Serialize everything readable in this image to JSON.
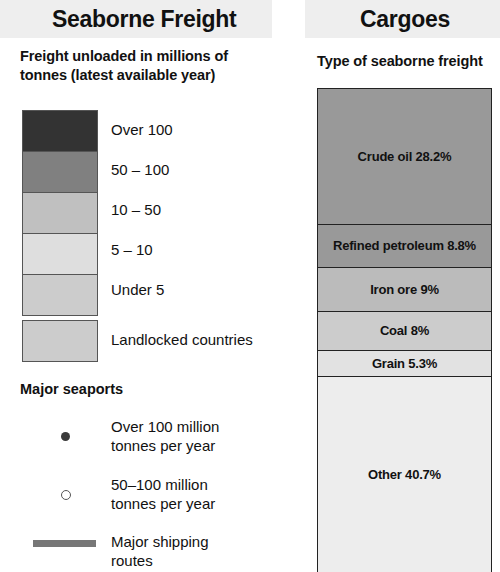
{
  "headers": {
    "left_title": "Seaborne Freight",
    "right_title": "Cargoes"
  },
  "freight_legend": {
    "subtitle": "Freight unloaded in millions of tonnes (latest available year)",
    "classes": [
      {
        "label": "Over 100",
        "color": "#333333"
      },
      {
        "label": "50 – 100",
        "color": "#808080"
      },
      {
        "label": "10 – 50",
        "color": "#c0c0c0"
      },
      {
        "label": "5 – 10",
        "color": "#dedede"
      },
      {
        "label": "Under 5",
        "color": "#cccccc"
      }
    ],
    "landlocked": {
      "label": "Landlocked countries",
      "color": "#cccccc"
    }
  },
  "seaports": {
    "heading": "Major seaports",
    "items": [
      {
        "label": "Over 100 million tonnes per year",
        "marker": "filled-dot",
        "color": "#3a3a3a"
      },
      {
        "label": "50–100 million tonnes per year",
        "marker": "hollow-dot",
        "color": "#555555"
      },
      {
        "label": "Major shipping routes",
        "marker": "thick-line",
        "color": "#777777"
      }
    ]
  },
  "cargoes": {
    "subtitle": "Type of seaborne freight"
  },
  "chart_data": {
    "type": "bar",
    "title": "Type of seaborne freight",
    "categories": [
      "Crude oil",
      "Refined petroleum",
      "Iron ore",
      "Coal",
      "Grain",
      "Other"
    ],
    "values": [
      28.2,
      8.8,
      9,
      8,
      5.3,
      40.7
    ],
    "labels": [
      "Crude oil 28.2%",
      "Refined petroleum 8.8%",
      "Iron ore 9%",
      "Coal 8%",
      "Grain 5.3%",
      "Other 40.7%"
    ],
    "colors": [
      "#999999",
      "#999999",
      "#bbbbbb",
      "#cccccc",
      "#e2e2e2",
      "#ededed"
    ],
    "xlabel": "",
    "ylabel": "Share of seaborne freight (%)",
    "ylim": [
      0,
      100
    ],
    "grid": false,
    "legend": "none",
    "stacked": true
  }
}
